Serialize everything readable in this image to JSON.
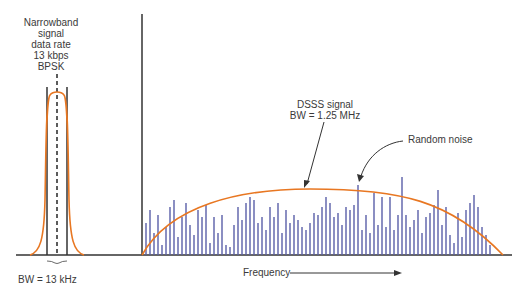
{
  "narrowband": {
    "label_lines": [
      "Narrowband",
      "signal",
      "data rate",
      "13 kbps",
      "BPSK"
    ],
    "bandwidth_label": "BW = 13 kHz"
  },
  "dsss": {
    "label_line1": "DSSS signal",
    "label_line2": "BW = 1.25 MHz"
  },
  "noise": {
    "label": "Random noise"
  },
  "axis": {
    "x_label": "Frequency"
  },
  "colors": {
    "signal_curve": "#e87722",
    "noise_bars": "#5a5fa8",
    "axis": "#333333"
  },
  "chart_data": {
    "type": "diagram",
    "title": "",
    "xlabel": "Frequency",
    "annotations": [
      "Narrowband signal data rate 13 kbps BPSK",
      "BW = 13 kHz",
      "DSSS signal BW = 1.25 MHz",
      "Random noise"
    ],
    "noise_bar_heights_px": [
      32,
      45,
      22,
      40,
      10,
      28,
      48,
      55,
      18,
      38,
      52,
      30,
      20,
      45,
      38,
      50,
      12,
      38,
      22,
      40,
      10,
      8,
      30,
      48,
      35,
      52,
      58,
      55,
      32,
      38,
      25,
      48,
      38,
      52,
      22,
      45,
      32,
      40,
      35,
      28,
      25,
      32,
      42,
      40,
      48,
      58,
      52,
      38,
      42,
      30,
      48,
      45,
      50,
      70,
      25,
      40,
      22,
      62,
      30,
      58,
      28,
      58,
      25,
      40,
      78,
      40,
      28,
      35,
      45,
      22,
      38,
      42,
      50,
      65,
      30,
      48,
      20,
      12,
      42,
      18,
      45,
      52,
      60,
      48,
      28,
      20,
      10
    ]
  }
}
